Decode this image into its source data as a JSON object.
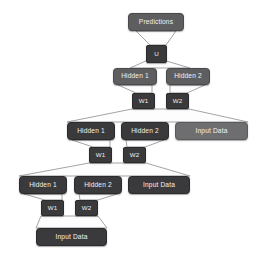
{
  "diagram": {
    "type": "node-graph",
    "background_color": "#ffffff",
    "palette": {
      "dark_node": "#3a3a3c",
      "mid_node": "#5e5e60",
      "light_node": "#6e6e70",
      "edge_color": "#9a9a9a",
      "text_color": "#f2f2f2"
    },
    "nodes": [
      {
        "id": "predictions",
        "label": "Predictions",
        "tone": "mid",
        "x": 128,
        "y": 13,
        "w": 56,
        "h": 18
      },
      {
        "id": "u",
        "label": "U",
        "tone": "dark",
        "x": 146,
        "y": 45,
        "w": 21,
        "h": 18
      },
      {
        "id": "h1-r1",
        "label": "Hidden 1",
        "tone": "mid",
        "x": 113,
        "y": 68,
        "w": 44,
        "h": 17
      },
      {
        "id": "h2-r1",
        "label": "Hidden 2",
        "tone": "mid",
        "x": 166,
        "y": 68,
        "w": 44,
        "h": 17
      },
      {
        "id": "w1-r1",
        "label": "W1",
        "tone": "dark",
        "x": 132,
        "y": 93,
        "w": 23,
        "h": 16
      },
      {
        "id": "w2-r1",
        "label": "W2",
        "tone": "dark",
        "x": 166,
        "y": 93,
        "w": 23,
        "h": 16
      },
      {
        "id": "h1-r2",
        "label": "Hidden 1",
        "tone": "dark",
        "x": 67,
        "y": 122,
        "w": 48,
        "h": 18
      },
      {
        "id": "h2-r2",
        "label": "Hidden 2",
        "tone": "dark",
        "x": 121,
        "y": 122,
        "w": 48,
        "h": 18
      },
      {
        "id": "in-r2",
        "label": "Input Data",
        "tone": "light",
        "x": 175,
        "y": 122,
        "w": 73,
        "h": 18
      },
      {
        "id": "w1-r2",
        "label": "W1",
        "tone": "dark",
        "x": 89,
        "y": 147,
        "w": 23,
        "h": 16
      },
      {
        "id": "w2-r2",
        "label": "W2",
        "tone": "dark",
        "x": 123,
        "y": 147,
        "w": 23,
        "h": 16
      },
      {
        "id": "h1-r3",
        "label": "Hidden 1",
        "tone": "dark",
        "x": 19,
        "y": 176,
        "w": 48,
        "h": 18
      },
      {
        "id": "h2-r3",
        "label": "Hidden 2",
        "tone": "dark",
        "x": 74,
        "y": 176,
        "w": 48,
        "h": 18
      },
      {
        "id": "in-r3",
        "label": "Input Data",
        "tone": "dark",
        "x": 128,
        "y": 176,
        "w": 62,
        "h": 18
      },
      {
        "id": "w1-r3",
        "label": "W1",
        "tone": "dark",
        "x": 41,
        "y": 200,
        "w": 23,
        "h": 16
      },
      {
        "id": "w2-r3",
        "label": "W2",
        "tone": "dark",
        "x": 75,
        "y": 200,
        "w": 23,
        "h": 16
      },
      {
        "id": "in-r4",
        "label": "Input Data",
        "tone": "dark",
        "x": 36,
        "y": 228,
        "w": 71,
        "h": 18
      }
    ],
    "edges": [
      {
        "from": "predictions",
        "to": "u",
        "kind": "fan",
        "points": "136,31 176,31 166,45 150,45"
      },
      {
        "from": "u",
        "to": "h1-r1",
        "kind": "fan",
        "points": "148,60 163,60 190,68 130,68"
      },
      {
        "from": "h1-r1",
        "to": "w1-r1",
        "kind": "fan",
        "points": "118,85 152,85 152,93 136,93"
      },
      {
        "from": "h2-r1",
        "to": "w2-r1",
        "kind": "fan",
        "points": "170,85 205,85 187,93 170,93"
      },
      {
        "from": "w1-r1",
        "to": "row2",
        "kind": "fan",
        "points": "132,109 189,109 248,122 67,122"
      },
      {
        "from": "h1-r2",
        "to": "w1-r2",
        "kind": "fan",
        "points": "72,140 110,140 110,147 93,147"
      },
      {
        "from": "h2-r2",
        "to": "w2-r2",
        "kind": "fan",
        "points": "126,140 164,140 145,147 127,147"
      },
      {
        "from": "w1-r2",
        "to": "row3",
        "kind": "fan",
        "points": "89,163 146,163 190,176 19,176"
      },
      {
        "from": "h1-r3",
        "to": "w1-r3",
        "kind": "fan",
        "points": "24,194 62,194 62,200 45,200"
      },
      {
        "from": "h2-r3",
        "to": "w2-r3",
        "kind": "fan",
        "points": "79,194 117,194 98,200 80,200"
      },
      {
        "from": "w1-r3",
        "to": "in-r4",
        "kind": "fan",
        "points": "41,216 98,216 107,228 36,228"
      }
    ]
  }
}
